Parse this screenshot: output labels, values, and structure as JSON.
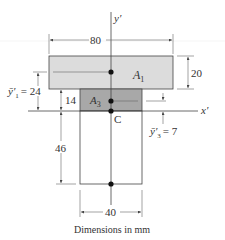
{
  "figure": {
    "caption": "Dimensions in mm",
    "colors": {
      "flange_fill": "#dcdcdc",
      "a3_fill": "#a8a8a8",
      "web_fill": "#ffffff",
      "outline": "#444444",
      "point": "#111111"
    },
    "axes": {
      "y_axis_label": "y′",
      "x_axis_label": "x′",
      "centroid_label": "C"
    },
    "areas": {
      "a1": {
        "label_main": "A",
        "label_sub": "1"
      },
      "a3": {
        "label_main": "A",
        "label_sub": "3"
      }
    },
    "dimensions": {
      "flange_width": "80",
      "flange_height": "20",
      "a3_height": "14",
      "web_below_axis": "46",
      "web_width": "40",
      "y1_bar": {
        "symbol": "ȳ′",
        "sub": "1",
        "value": "= 24"
      },
      "y3_bar": {
        "symbol": "ȳ′",
        "sub": "3",
        "value": "= 7"
      }
    }
  }
}
